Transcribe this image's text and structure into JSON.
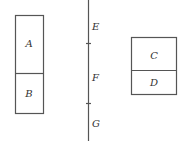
{
  "diagram": {
    "left_box": {
      "top_label": "A",
      "bottom_label": "B"
    },
    "vertical_line": {
      "labels": [
        "E",
        "F",
        "G"
      ]
    },
    "right_box": {
      "top_label": "C",
      "bottom_label": "D"
    },
    "colors": {
      "stroke": "#555555",
      "text": "#333333",
      "background": "#ffffff"
    }
  }
}
